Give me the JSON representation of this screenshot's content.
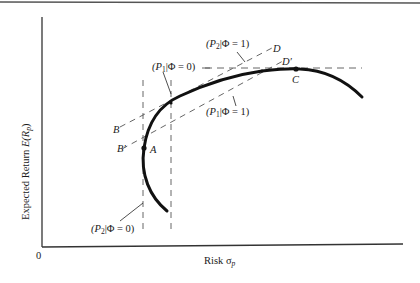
{
  "figure": {
    "type": "diagram"
  },
  "axes": {
    "x_label": "Risk σ",
    "x_label_sub": "p",
    "y_label_prefix": "Expected Return ",
    "y_label_E": "E(R",
    "y_label_sub": "p",
    "y_label_suffix": ")",
    "origin": "0"
  },
  "points": {
    "A": "A",
    "B": "B",
    "B_prime": "B′",
    "C": "C",
    "D": "D",
    "D_prime": "D′"
  },
  "annotations": {
    "p1_phi0": {
      "open": "(P",
      "sub": "1",
      "rest": "|Φ = 0)"
    },
    "p1_phi1": {
      "open": "(P",
      "sub": "1",
      "rest": "|Φ = 1)"
    },
    "p2_phi0": {
      "open": "(P",
      "sub": "2",
      "rest": "|Φ = 0)"
    },
    "p2_phi1": {
      "open": "(P",
      "sub": "2",
      "rest": "|Φ = 1)"
    }
  },
  "colors": {
    "ink": "#111111",
    "dash": "#555555",
    "axis": "#333333"
  }
}
